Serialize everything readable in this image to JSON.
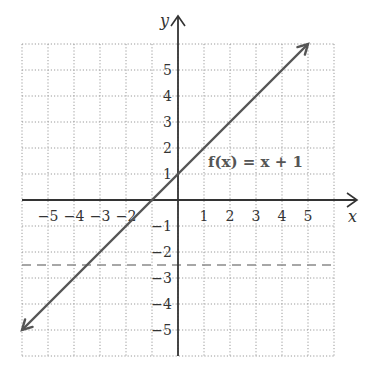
{
  "chart_data": {
    "type": "line",
    "title": "",
    "xlabel": "x",
    "ylabel": "y",
    "xlim": [
      -6,
      6
    ],
    "ylim": [
      -6,
      6
    ],
    "grid": true,
    "grid_style": "dotted",
    "x_ticks": [
      -5,
      -4,
      -3,
      -2,
      1,
      2,
      3,
      4,
      5
    ],
    "x_tick_labels": [
      "−5",
      "−4",
      "−3",
      "−2",
      "1",
      "2",
      "3",
      "4",
      "5"
    ],
    "y_ticks": [
      5,
      4,
      3,
      2,
      1,
      -1,
      -2,
      -3,
      -4,
      -5
    ],
    "y_tick_labels": [
      "5",
      "4",
      "3",
      "2",
      "1",
      "−1",
      "−2",
      "−3",
      "−4",
      "−5"
    ],
    "series": [
      {
        "name": "f(x) = x + 1",
        "style": "solid",
        "arrows": "both",
        "color": "#555555",
        "x": [
          -6,
          5
        ],
        "y": [
          -5,
          6
        ]
      },
      {
        "name": "horizontal dashed line y = -2.5",
        "style": "dashed",
        "color": "#888888",
        "x": [
          -6,
          6
        ],
        "y": [
          -2.5,
          -2.5
        ]
      }
    ],
    "annotations": [
      {
        "text": "f(x) = x + 1",
        "x": 1.2,
        "y": 1.5
      }
    ]
  },
  "labels": {
    "x_axis": "x",
    "y_axis": "y",
    "function": "f(x) = x + 1"
  },
  "colors": {
    "axis": "#333333",
    "grid": "#9a9a9a",
    "function_line": "#555555",
    "dashed_line": "#8a8a8a"
  }
}
